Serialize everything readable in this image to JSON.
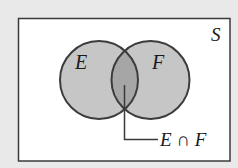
{
  "diagram": {
    "type": "venn",
    "universe_label": "S",
    "sets": [
      {
        "id": "E",
        "label": "E"
      },
      {
        "id": "F",
        "label": "F"
      }
    ],
    "intersection_label": "E ∩ F",
    "colors": {
      "page_background": "#e9e9e9",
      "universe_fill": "#ffffff",
      "universe_stroke": "#3a3a3a",
      "circle_fill": "#c6c6c6",
      "intersection_fill": "#a6a6a6",
      "circle_stroke": "#3c3c3c",
      "leader_line": "#3a3a3a",
      "text": "#1a1a1a"
    }
  }
}
